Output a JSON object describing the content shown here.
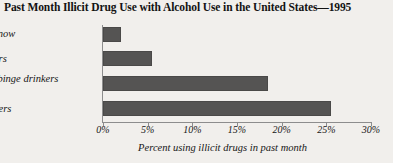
{
  "chart_data": {
    "type": "bar",
    "orientation": "horizontal",
    "title": "Past Month Illicit Drug Use with Alcohol Use in the United States—1995",
    "categories": [
      "Don't drink now",
      "Light drinkers",
      "Occasional binge drinkers",
      "Heavy drinkers"
    ],
    "values": [
      2,
      5.5,
      18.5,
      25.5
    ],
    "xlabel": "Percent using illicit drugs in past month",
    "ylabel": "",
    "xlim": [
      0,
      30
    ],
    "xticks": [
      0,
      5,
      10,
      15,
      20,
      25,
      30
    ],
    "xticklabels": [
      "0%",
      "5%",
      "10%",
      "15%",
      "20%",
      "25%",
      "30%"
    ],
    "grid": false,
    "legend": false,
    "bar_color": "#555453",
    "background_color": "#f1efec",
    "axis_color": "#8d8d8d"
  }
}
